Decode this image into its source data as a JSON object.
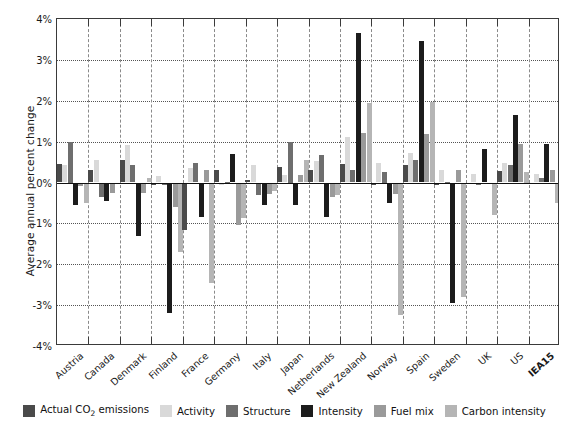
{
  "axis": {
    "ylabel": "Average annual percent change",
    "yticks": [
      "4%",
      "3%",
      "2%",
      "1%",
      "0%",
      "-1%",
      "-2%",
      "-3%",
      "-4%"
    ],
    "ytick_values": [
      4,
      3,
      2,
      1,
      0,
      -1,
      -2,
      -3,
      -4
    ],
    "ylim": [
      -4,
      4
    ],
    "xlabel": ""
  },
  "legend": {
    "position": "bottom",
    "items": [
      {
        "label": "Actual CO2 emissions",
        "label_html": "Actual CO<sub>2</sub> emissions",
        "color": "#4a4a4a"
      },
      {
        "label": "Activity",
        "color": "#d9d9d9"
      },
      {
        "label": "Structure",
        "color": "#6e6e6e"
      },
      {
        "label": "Intensity",
        "color": "#1c1c1c"
      },
      {
        "label": "Fuel mix",
        "color": "#9a9a9a"
      },
      {
        "label": "Carbon intensity",
        "color": "#b5b5b5"
      }
    ]
  },
  "chart_data": {
    "type": "bar",
    "title": "",
    "subtitle": "",
    "xlabel": "",
    "ylabel": "Average annual percent change",
    "ylim": [
      -4,
      4
    ],
    "ytick_values": [
      4,
      3,
      2,
      1,
      0,
      -1,
      -2,
      -3,
      -4
    ],
    "grid": true,
    "legend_position": "bottom",
    "categories": [
      "Austria",
      "Canada",
      "Denmark",
      "Finland",
      "France",
      "Germany",
      "Italy",
      "Japan",
      "Netherlands",
      "New Zealand",
      "Norway",
      "Spain",
      "Sweden",
      "UK",
      "US",
      "IEA15"
    ],
    "series": [
      {
        "name": "Actual CO2 emissions",
        "color": "#4a4a4a",
        "values": [
          0.45,
          0.3,
          0.55,
          -0.05,
          -1.15,
          0.3,
          0.05,
          0.38,
          0.3,
          0.45,
          -0.07,
          0.43,
          -0.05,
          -0.03,
          0.28,
          -0.02
        ]
      },
      {
        "name": "Activity",
        "color": "#d9d9d9",
        "values": [
          0.42,
          0.55,
          0.92,
          0.15,
          0.35,
          -0.05,
          0.42,
          0.18,
          0.52,
          1.12,
          0.48,
          0.72,
          0.3,
          0.22,
          0.48,
          0.2
        ]
      },
      {
        "name": "Structure",
        "color": "#6e6e6e",
        "values": [
          1.0,
          -0.35,
          0.42,
          -0.05,
          0.48,
          0.02,
          -0.3,
          1.0,
          0.68,
          0.3,
          0.25,
          0.55,
          0.02,
          -0.05,
          0.42,
          0.1
        ]
      },
      {
        "name": "Intensity",
        "color": "#1c1c1c",
        "values": [
          -0.55,
          -0.45,
          -1.3,
          -3.2,
          -0.85,
          0.7,
          -0.55,
          -0.55,
          -0.85,
          3.65,
          -0.5,
          3.45,
          -2.95,
          0.82,
          1.65,
          0.95
        ]
      },
      {
        "name": "Fuel mix",
        "color": "#9a9a9a",
        "values": [
          -0.08,
          -0.25,
          -0.25,
          -0.6,
          0.3,
          -1.05,
          -0.28,
          0.18,
          -0.35,
          1.22,
          -0.28,
          1.18,
          0.3,
          -0.03,
          0.95,
          0.3
        ]
      },
      {
        "name": "Carbon intensity",
        "color": "#b5b5b5",
        "values": [
          -0.5,
          -0.02,
          0.1,
          -1.7,
          -2.45,
          -0.88,
          -0.2,
          0.55,
          -0.3,
          1.95,
          -3.25,
          1.98,
          -2.8,
          -0.8,
          0.25,
          -0.5
        ]
      }
    ]
  }
}
